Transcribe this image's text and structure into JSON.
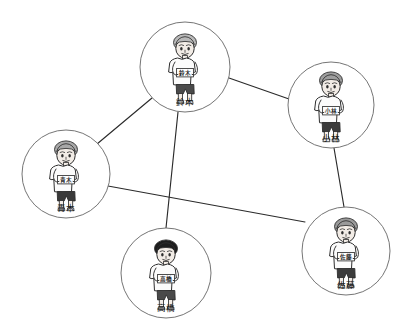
{
  "diagram": {
    "type": "social-network-graph",
    "title": "",
    "background_color": "#ffffff",
    "line_color": "#2b2b2b",
    "circle_stroke_color": "#6e6e6e",
    "label_color": "#1a1a1a",
    "nodes": [
      {
        "id": "suzuki",
        "label": "鈴木",
        "shirt_text": "鈴木",
        "cx": 185,
        "cy": 67,
        "r": 45,
        "hair_color": "#b9b9b9",
        "hair_style": "curly-light",
        "shorts_color": "#4a4a4a",
        "skin_color": "#f2ece6"
      },
      {
        "id": "kobayashi",
        "label": "小林",
        "shirt_text": "小林",
        "cx": 331,
        "cy": 105,
        "r": 43,
        "hair_color": "#9e9e9e",
        "hair_style": "spiky",
        "shorts_color": "#3c3c3c",
        "skin_color": "#f2ece6"
      },
      {
        "id": "aoki",
        "label": "青木",
        "shirt_text": "青木",
        "cx": 66,
        "cy": 174,
        "r": 44,
        "hair_color": "#a8a8a8",
        "hair_style": "side-part",
        "shorts_color": "#3a3a3a",
        "skin_color": "#f2ece6"
      },
      {
        "id": "takahashi",
        "label": "高橋",
        "shirt_text": "高橋",
        "cx": 166,
        "cy": 273,
        "r": 45,
        "hair_color": "#1d1d1d",
        "hair_style": "short-dark",
        "shorts_color": "#4a4a4a",
        "skin_color": "#f2ece6"
      },
      {
        "id": "sato",
        "label": "佐藤",
        "shirt_text": "佐藤",
        "cx": 346,
        "cy": 251,
        "r": 44,
        "hair_color": "#9a9a9a",
        "hair_style": "wavy",
        "shorts_color": "#3c3c3c",
        "skin_color": "#f2ece6"
      }
    ],
    "edges": [
      {
        "id": "edge-suzuki-aoki",
        "source": "suzuki",
        "target": "aoki",
        "x1": 152,
        "y1": 98,
        "x2": 97,
        "y2": 144
      },
      {
        "id": "edge-suzuki-kobayashi",
        "source": "suzuki",
        "target": "kobayashi",
        "x1": 229,
        "y1": 78,
        "x2": 289,
        "y2": 99
      },
      {
        "id": "edge-suzuki-takahashi",
        "source": "suzuki",
        "target": "takahashi",
        "x1": 178,
        "y1": 112,
        "x2": 166,
        "y2": 228
      },
      {
        "id": "edge-kobayashi-sato",
        "source": "kobayashi",
        "target": "sato",
        "x1": 334,
        "y1": 148,
        "x2": 344,
        "y2": 207
      },
      {
        "id": "edge-aoki-sato",
        "source": "aoki",
        "target": "sato",
        "x1": 108,
        "y1": 186,
        "x2": 305,
        "y2": 222
      }
    ]
  }
}
